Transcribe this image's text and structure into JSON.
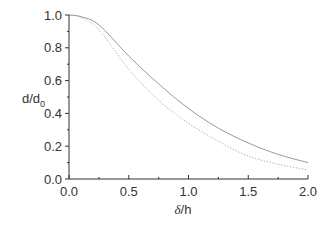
{
  "chart_data": {
    "type": "line",
    "title": "",
    "xlabel": "δ/h",
    "ylabel": "d/d0",
    "ylabel_main": "d/d",
    "ylabel_sub": "0",
    "xlabel_main": "δ",
    "xlabel_rest": "/h",
    "xlim": [
      0.0,
      2.0
    ],
    "ylim": [
      0.0,
      1.0
    ],
    "grid": false,
    "legend": "none",
    "x_ticks": [
      "0.0",
      "0.5",
      "1.0",
      "1.5",
      "2.0"
    ],
    "y_ticks": [
      "0.0",
      "0.2",
      "0.4",
      "0.6",
      "0.8",
      "1.0"
    ],
    "x": [
      0.0,
      0.1,
      0.25,
      0.5,
      0.75,
      1.0,
      1.25,
      1.5,
      1.75,
      2.0
    ],
    "series": [
      {
        "name": "solid",
        "style": "solid",
        "color": "#999999",
        "values": [
          1.0,
          0.99,
          0.94,
          0.75,
          0.58,
          0.43,
          0.31,
          0.22,
          0.15,
          0.1
        ]
      },
      {
        "name": "dotted",
        "style": "dotted",
        "color": "#aaaaaa",
        "values": [
          1.0,
          0.985,
          0.91,
          0.67,
          0.48,
          0.34,
          0.23,
          0.14,
          0.09,
          0.055
        ]
      }
    ]
  }
}
